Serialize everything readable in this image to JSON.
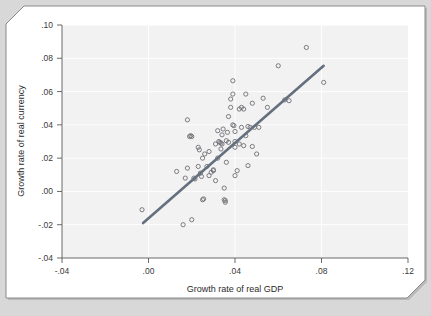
{
  "figure": {
    "background_color": "#d8d8d8",
    "card_color": "#ffffff",
    "panel_color": "#f2f2f2"
  },
  "axes": {
    "x_title": "Growth rate of real GDP",
    "y_title": "Growth rate of real currency",
    "x_ticks": [
      "-.04",
      ".00",
      ".04",
      ".08",
      ".12"
    ],
    "y_ticks": [
      ".10",
      ".08",
      ".06",
      ".04",
      ".02",
      ".00",
      "-.02",
      "-.04"
    ]
  },
  "chart_data": {
    "type": "scatter",
    "title": "",
    "xlabel": "Growth rate of real GDP",
    "ylabel": "Growth rate of real currency",
    "xlim": [
      -0.04,
      0.12
    ],
    "ylim": [
      -0.04,
      0.1
    ],
    "xticks": [
      -0.04,
      0.0,
      0.04,
      0.08,
      0.12
    ],
    "xticklabels": [
      "-.04",
      ".00",
      ".04",
      ".08",
      ".12"
    ],
    "yticks": [
      0.1,
      0.08,
      0.06,
      0.04,
      0.02,
      0.0,
      -0.02,
      -0.04
    ],
    "yticklabels": [
      ".10",
      ".08",
      ".06",
      ".04",
      ".02",
      ".00",
      "-.02",
      "-.04"
    ],
    "grid": true,
    "legend": "none",
    "marker": "open-circle",
    "marker_color": "#6f6f75",
    "series": [
      {
        "name": "countries",
        "points": [
          [
            -0.003,
            -0.011
          ],
          [
            0.013,
            0.012
          ],
          [
            0.016,
            -0.02
          ],
          [
            0.017,
            0.008
          ],
          [
            0.018,
            0.014
          ],
          [
            0.018,
            0.043
          ],
          [
            0.019,
            0.033
          ],
          [
            0.0195,
            0.0335
          ],
          [
            0.02,
            0.033
          ],
          [
            0.02,
            -0.017
          ],
          [
            0.021,
            0.008
          ],
          [
            0.0215,
            0.0075
          ],
          [
            0.023,
            0.015
          ],
          [
            0.023,
            0.0265
          ],
          [
            0.0235,
            0.025
          ],
          [
            0.024,
            0.011
          ],
          [
            0.0245,
            0.009
          ],
          [
            0.025,
            0.02
          ],
          [
            0.025,
            -0.005
          ],
          [
            0.0255,
            -0.0045
          ],
          [
            0.026,
            0.0225
          ],
          [
            0.027,
            0.015
          ],
          [
            0.028,
            0.024
          ],
          [
            0.028,
            0.0095
          ],
          [
            0.029,
            0.0115
          ],
          [
            0.03,
            0.013
          ],
          [
            0.03,
            0.0125
          ],
          [
            0.031,
            0.0065
          ],
          [
            0.031,
            0.0285
          ],
          [
            0.032,
            0.02
          ],
          [
            0.032,
            0.0365
          ],
          [
            0.0325,
            0.03
          ],
          [
            0.033,
            0.0295
          ],
          [
            0.0335,
            0.029
          ],
          [
            0.0335,
            0.0255
          ],
          [
            0.034,
            0.0285
          ],
          [
            0.034,
            0.034
          ],
          [
            0.0345,
            0.0375
          ],
          [
            0.035,
            0.002
          ],
          [
            0.035,
            -0.005
          ],
          [
            0.0355,
            -0.0055
          ],
          [
            0.0355,
            -0.0065
          ],
          [
            0.036,
            0.0175
          ],
          [
            0.036,
            0.0305
          ],
          [
            0.0365,
            0.0355
          ],
          [
            0.037,
            0.0295
          ],
          [
            0.037,
            0.045
          ],
          [
            0.038,
            0.0505
          ],
          [
            0.038,
            0.0555
          ],
          [
            0.039,
            0.0665
          ],
          [
            0.039,
            0.0585
          ],
          [
            0.039,
            0.04
          ],
          [
            0.0395,
            0.0395
          ],
          [
            0.04,
            0.036
          ],
          [
            0.04,
            0.03
          ],
          [
            0.04,
            0.0265
          ],
          [
            0.04,
            0.0095
          ],
          [
            0.041,
            0.0125
          ],
          [
            0.042,
            0.0285
          ],
          [
            0.042,
            0.0495
          ],
          [
            0.043,
            0.0385
          ],
          [
            0.043,
            0.0505
          ],
          [
            0.044,
            0.0495
          ],
          [
            0.044,
            0.0275
          ],
          [
            0.045,
            0.0335
          ],
          [
            0.045,
            0.0585
          ],
          [
            0.046,
            0.039
          ],
          [
            0.046,
            0.0155
          ],
          [
            0.047,
            0.0385
          ],
          [
            0.048,
            0.027
          ],
          [
            0.048,
            0.053
          ],
          [
            0.049,
            0.0385
          ],
          [
            0.05,
            0.0225
          ],
          [
            0.051,
            0.0385
          ],
          [
            0.053,
            0.056
          ],
          [
            0.055,
            0.0505
          ],
          [
            0.06,
            0.0755
          ],
          [
            0.063,
            0.055
          ],
          [
            0.065,
            0.0545
          ],
          [
            0.073,
            0.0865
          ],
          [
            0.081,
            0.0655
          ]
        ]
      }
    ],
    "fit_line": {
      "name": "regression line",
      "color": "#64707e",
      "x_start": -0.0025,
      "y_start": -0.019,
      "x_end": 0.081,
      "y_end": 0.0755
    }
  }
}
